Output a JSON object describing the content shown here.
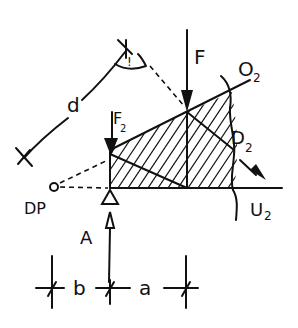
{
  "diagram": {
    "type": "hand-drawn structural sketch",
    "labels": {
      "d": "d",
      "F": "F",
      "F_small_main": "F",
      "F_small_sub": "2",
      "O2_main": "O",
      "O2_sub": "2",
      "D2_main": "D",
      "D2_sub": "2",
      "U2_main": "U",
      "U2_sub": "2",
      "DP": "DP",
      "A": "A",
      "b": "b",
      "a": "a",
      "angle_mark": "!"
    },
    "colors": {
      "ink": "#111111",
      "background": "#ffffff"
    }
  }
}
